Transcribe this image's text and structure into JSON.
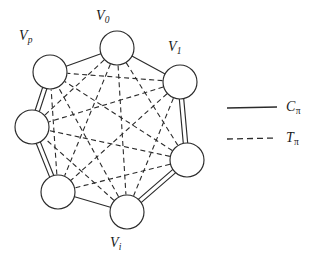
{
  "figure": {
    "type": "graph-diagram",
    "background_color": "#ffffff",
    "ink_color": "#2b2b2b",
    "node_radius": 17,
    "nodes": [
      {
        "id": "v0",
        "label": "V",
        "subscript": "0",
        "cx": 117,
        "cy": 48,
        "has_label": true
      },
      {
        "id": "v1",
        "label": "V",
        "subscript": "1",
        "cx": 180,
        "cy": 82,
        "has_label": true
      },
      {
        "id": "n2",
        "label": "",
        "subscript": "",
        "cx": 187,
        "cy": 160,
        "has_label": false
      },
      {
        "id": "vi",
        "label": "V",
        "subscript": "i",
        "cx": 127,
        "cy": 212,
        "has_label": true
      },
      {
        "id": "n4",
        "label": "",
        "subscript": "",
        "cx": 58,
        "cy": 192,
        "has_label": false
      },
      {
        "id": "n5",
        "label": "",
        "subscript": "",
        "cx": 32,
        "cy": 127,
        "has_label": false
      },
      {
        "id": "vp",
        "label": "V",
        "subscript": "p",
        "cx": 50,
        "cy": 72,
        "has_label": true
      }
    ],
    "cycle_edges": [
      {
        "from": "vp",
        "to": "v0",
        "style": "single"
      },
      {
        "from": "v0",
        "to": "v1",
        "style": "single"
      },
      {
        "from": "v1",
        "to": "n2",
        "style": "double"
      },
      {
        "from": "n2",
        "to": "vi",
        "style": "double"
      },
      {
        "from": "vi",
        "to": "n4",
        "style": "single"
      },
      {
        "from": "n4",
        "to": "n5",
        "style": "double"
      },
      {
        "from": "n5",
        "to": "vp",
        "style": "double"
      }
    ],
    "chord_edges": [
      {
        "from": "v0",
        "to": "n2"
      },
      {
        "from": "v0",
        "to": "vi"
      },
      {
        "from": "v0",
        "to": "n4"
      },
      {
        "from": "v0",
        "to": "n5"
      },
      {
        "from": "v1",
        "to": "vi"
      },
      {
        "from": "v1",
        "to": "n4"
      },
      {
        "from": "v1",
        "to": "n5"
      },
      {
        "from": "v1",
        "to": "vp"
      },
      {
        "from": "n2",
        "to": "n4"
      },
      {
        "from": "n2",
        "to": "n5"
      },
      {
        "from": "n2",
        "to": "vp"
      },
      {
        "from": "vi",
        "to": "n5"
      },
      {
        "from": "vi",
        "to": "vp"
      },
      {
        "from": "n4",
        "to": "vp"
      }
    ]
  },
  "labels": {
    "v0": {
      "base": "V",
      "sub": "0"
    },
    "v1": {
      "base": "V",
      "sub": "1"
    },
    "vi": {
      "base": "V",
      "sub": "i"
    },
    "vp": {
      "base": "V",
      "sub": "p"
    }
  },
  "legend": {
    "items": [
      {
        "id": "cycle",
        "line_style": "solid",
        "base": "C",
        "sub": "π"
      },
      {
        "id": "tree",
        "line_style": "dashed",
        "base": "T",
        "sub": "π"
      }
    ]
  }
}
